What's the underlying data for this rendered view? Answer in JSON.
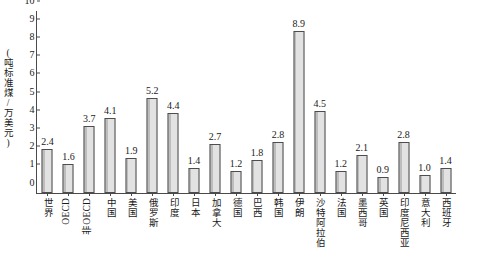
{
  "chart_data": {
    "type": "bar",
    "title": "",
    "xlabel": "",
    "ylabel": "(吨标准煤/万美元)",
    "ylim": [
      0,
      10
    ],
    "ytick_labels": [
      "10",
      "9",
      "8",
      "7",
      "6",
      "5",
      "4",
      "3",
      "2",
      "1",
      "0"
    ],
    "grid": false,
    "legend": null,
    "categories": [
      "世界",
      "OECD",
      "非OECD",
      "中国",
      "美国",
      "俄罗斯",
      "印度",
      "日本",
      "加拿大",
      "德国",
      "巴西",
      "韩国",
      "伊朗",
      "沙特阿拉伯",
      "法国",
      "墨西哥",
      "英国",
      "印度尼西亚",
      "意大利",
      "西班牙"
    ],
    "values": [
      2.4,
      1.6,
      3.7,
      4.1,
      1.9,
      5.2,
      4.4,
      1.4,
      2.7,
      1.2,
      1.8,
      2.8,
      8.9,
      4.5,
      1.2,
      2.1,
      0.9,
      2.8,
      1.0,
      1.4
    ],
    "value_labels": [
      "2.4",
      "1.6",
      "3.7",
      "4.1",
      "1.9",
      "5.2",
      "4.4",
      "1.4",
      "2.7",
      "1.2",
      "1.8",
      "2.8",
      "8.9",
      "4.5",
      "1.2",
      "2.1",
      "0.9",
      "2.8",
      "1.0",
      "1.4"
    ],
    "is_latin": [
      false,
      true,
      true,
      false,
      false,
      false,
      false,
      false,
      false,
      false,
      false,
      false,
      false,
      false,
      false,
      false,
      false,
      false,
      false,
      false
    ],
    "colors": {
      "bar_fill": "#dcdcdc",
      "bar_stroke": "#4d4d4d",
      "axis": "#4a4a4a",
      "text": "#1a1a1a",
      "background": "#ffffff"
    }
  }
}
